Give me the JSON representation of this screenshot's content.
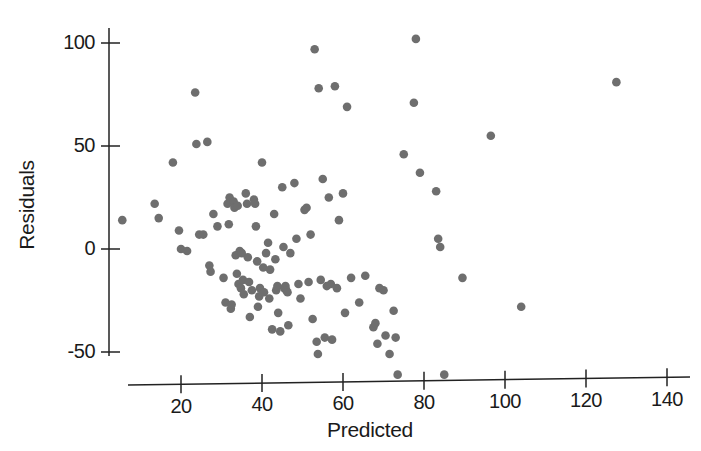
{
  "figure": {
    "background_color": "#ffffff",
    "point_color": "#6e6e6e",
    "axis_color": "#222222",
    "point_radius": 4.3
  },
  "axes": {
    "x_title": "Predicted",
    "y_title": "Residuals",
    "x_ticks": [
      20,
      40,
      60,
      80,
      100,
      120,
      140
    ],
    "y_ticks": [
      -50,
      0,
      50,
      100
    ],
    "x_tick_labels": [
      "20",
      "40",
      "60",
      "80",
      "100",
      "120",
      "140"
    ],
    "y_tick_labels": [
      "-50",
      "0",
      "50",
      "100"
    ]
  },
  "chart_data": {
    "type": "scatter",
    "title": "",
    "xlabel": "Predicted",
    "ylabel": "Residuals",
    "xlim": [
      0,
      148
    ],
    "ylim": [
      -68,
      110
    ],
    "grid": false,
    "legend": "none",
    "x_ticks": [
      20,
      40,
      60,
      80,
      100,
      120,
      140
    ],
    "y_ticks": [
      -50,
      0,
      50,
      100
    ],
    "series": [
      {
        "name": "residuals",
        "marker": "circle",
        "color": "#6e6e6e",
        "points": [
          [
            5.5,
            14
          ],
          [
            13.5,
            22
          ],
          [
            14.5,
            15
          ],
          [
            18.0,
            42
          ],
          [
            19.5,
            9
          ],
          [
            20.0,
            0
          ],
          [
            21.5,
            -1
          ],
          [
            23.5,
            76
          ],
          [
            23.8,
            51
          ],
          [
            24.5,
            7
          ],
          [
            25.5,
            7
          ],
          [
            26.5,
            52
          ],
          [
            27.0,
            -8
          ],
          [
            27.3,
            -11
          ],
          [
            28.0,
            17
          ],
          [
            29.0,
            11
          ],
          [
            30.5,
            -14
          ],
          [
            31.0,
            -26
          ],
          [
            31.5,
            22
          ],
          [
            31.8,
            12
          ],
          [
            32.0,
            25
          ],
          [
            32.3,
            -29
          ],
          [
            32.5,
            -27
          ],
          [
            33.0,
            23
          ],
          [
            33.2,
            20
          ],
          [
            33.5,
            -3
          ],
          [
            33.8,
            -12
          ],
          [
            34.0,
            21
          ],
          [
            34.2,
            -17
          ],
          [
            34.5,
            -1
          ],
          [
            34.8,
            -19
          ],
          [
            35.0,
            -2
          ],
          [
            35.3,
            -15
          ],
          [
            35.5,
            -22
          ],
          [
            36.0,
            27
          ],
          [
            36.3,
            22
          ],
          [
            36.5,
            -4
          ],
          [
            36.8,
            -16
          ],
          [
            37.0,
            -33
          ],
          [
            37.5,
            -20
          ],
          [
            38.0,
            24
          ],
          [
            38.3,
            22
          ],
          [
            38.5,
            11
          ],
          [
            38.8,
            -6
          ],
          [
            39.0,
            -28
          ],
          [
            39.3,
            -23
          ],
          [
            39.5,
            -19
          ],
          [
            40.0,
            42
          ],
          [
            40.3,
            -9
          ],
          [
            40.5,
            -21
          ],
          [
            41.0,
            -2
          ],
          [
            41.5,
            3
          ],
          [
            41.8,
            -24
          ],
          [
            42.0,
            -10
          ],
          [
            42.5,
            -39
          ],
          [
            43.0,
            17
          ],
          [
            43.3,
            -5
          ],
          [
            43.5,
            -20
          ],
          [
            43.8,
            -18
          ],
          [
            44.0,
            -31
          ],
          [
            44.5,
            -40
          ],
          [
            45.0,
            30
          ],
          [
            45.3,
            1
          ],
          [
            45.5,
            -19
          ],
          [
            45.8,
            -18
          ],
          [
            46.0,
            -20
          ],
          [
            46.3,
            -21
          ],
          [
            46.5,
            -37
          ],
          [
            47.0,
            -2
          ],
          [
            48.0,
            32
          ],
          [
            48.5,
            5
          ],
          [
            49.0,
            -17
          ],
          [
            49.5,
            -24
          ],
          [
            50.5,
            19
          ],
          [
            51.0,
            20
          ],
          [
            51.5,
            -16
          ],
          [
            52.0,
            7
          ],
          [
            52.5,
            -34
          ],
          [
            53.0,
            97
          ],
          [
            53.5,
            -45
          ],
          [
            53.8,
            -51
          ],
          [
            54.0,
            78
          ],
          [
            54.5,
            -15
          ],
          [
            55.0,
            34
          ],
          [
            55.5,
            -43
          ],
          [
            56.0,
            -18
          ],
          [
            56.5,
            25
          ],
          [
            57.0,
            -17
          ],
          [
            57.3,
            -44
          ],
          [
            58.0,
            79
          ],
          [
            58.5,
            -19
          ],
          [
            59.0,
            14
          ],
          [
            60.0,
            27
          ],
          [
            60.5,
            -31
          ],
          [
            61.0,
            69
          ],
          [
            62.0,
            -14
          ],
          [
            64.0,
            -26
          ],
          [
            65.5,
            -13
          ],
          [
            67.5,
            -38
          ],
          [
            68.0,
            -36
          ],
          [
            68.5,
            -46
          ],
          [
            69.0,
            -19
          ],
          [
            70.0,
            -20
          ],
          [
            70.5,
            -42
          ],
          [
            71.5,
            -51
          ],
          [
            72.5,
            -30
          ],
          [
            73.0,
            -43
          ],
          [
            73.5,
            -61
          ],
          [
            75.0,
            46
          ],
          [
            77.5,
            71
          ],
          [
            78.0,
            102
          ],
          [
            79.0,
            37
          ],
          [
            83.0,
            28
          ],
          [
            83.5,
            5
          ],
          [
            84.0,
            1
          ],
          [
            85.0,
            -61
          ],
          [
            89.5,
            -14
          ],
          [
            96.5,
            55
          ],
          [
            104.0,
            -28
          ],
          [
            127.5,
            81
          ]
        ]
      }
    ]
  }
}
